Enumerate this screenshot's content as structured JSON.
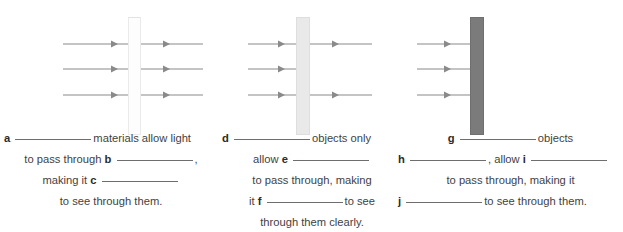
{
  "diagram": {
    "panels": [
      {
        "id": "panel-transparent",
        "material_type": "transparent",
        "barrier_color": "#fdfdfd",
        "barrier_border": "#eaeaea",
        "rays_in": 3,
        "rays_out": 3,
        "ray_color": "#8a8a8a",
        "note": "all three light rays pass through the barrier"
      },
      {
        "id": "panel-translucent",
        "material_type": "translucent",
        "barrier_color": "#e9e9e9",
        "barrier_border": "#dedede",
        "rays_in": 3,
        "rays_out": 2,
        "ray_color": "#8a8a8a",
        "note": "middle ray is blocked; top and bottom rays pass through"
      },
      {
        "id": "panel-opaque",
        "material_type": "opaque",
        "barrier_color": "#7b7b7b",
        "barrier_border": "#6f6f6f",
        "rays_in": 3,
        "rays_out": 0,
        "ray_color": "#8a8a8a",
        "note": "all rays are blocked at the barrier"
      }
    ]
  },
  "captions": {
    "transparent": {
      "lines": [
        {
          "align": "left",
          "parts": [
            {
              "type": "label",
              "text": "a"
            },
            {
              "type": "blank",
              "size": "long"
            },
            {
              "type": "text",
              "text": "materials allow light"
            }
          ]
        },
        {
          "align": "center",
          "parts": [
            {
              "type": "text",
              "text": "to pass through"
            },
            {
              "type": "label",
              "text": "b"
            },
            {
              "type": "blank",
              "size": "long"
            },
            {
              "type": "text",
              "text": ","
            }
          ]
        },
        {
          "align": "center",
          "parts": [
            {
              "type": "text",
              "text": "making it"
            },
            {
              "type": "label",
              "text": "c"
            },
            {
              "type": "blank",
              "size": "long"
            }
          ]
        },
        {
          "align": "center",
          "parts": [
            {
              "type": "text",
              "text": "to see through them."
            }
          ]
        }
      ]
    },
    "translucent": {
      "lines": [
        {
          "align": "left",
          "parts": [
            {
              "type": "label",
              "text": "d"
            },
            {
              "type": "blank",
              "size": "long"
            },
            {
              "type": "text",
              "text": "objects only"
            }
          ]
        },
        {
          "align": "center",
          "parts": [
            {
              "type": "text",
              "text": "allow"
            },
            {
              "type": "label",
              "text": "e"
            },
            {
              "type": "blank",
              "size": "long"
            }
          ]
        },
        {
          "align": "center",
          "parts": [
            {
              "type": "text",
              "text": "to pass through, making"
            }
          ]
        },
        {
          "align": "center",
          "parts": [
            {
              "type": "text",
              "text": "it"
            },
            {
              "type": "label",
              "text": "f"
            },
            {
              "type": "blank",
              "size": "long"
            },
            {
              "type": "text",
              "text": "to see"
            }
          ]
        },
        {
          "align": "center",
          "parts": [
            {
              "type": "text",
              "text": "through them clearly."
            }
          ]
        }
      ]
    },
    "opaque": {
      "lines": [
        {
          "align": "center",
          "parts": [
            {
              "type": "label",
              "text": "g"
            },
            {
              "type": "blank",
              "size": "long"
            },
            {
              "type": "text",
              "text": "objects"
            }
          ]
        },
        {
          "align": "left",
          "parts": [
            {
              "type": "label",
              "text": "h"
            },
            {
              "type": "blank",
              "size": "long"
            },
            {
              "type": "text",
              "text": ", allow"
            },
            {
              "type": "label",
              "text": "i"
            },
            {
              "type": "blank",
              "size": "long"
            }
          ]
        },
        {
          "align": "center",
          "parts": [
            {
              "type": "text",
              "text": "to pass through, making it"
            }
          ]
        },
        {
          "align": "left",
          "parts": [
            {
              "type": "label",
              "text": "j"
            },
            {
              "type": "blank",
              "size": "long"
            },
            {
              "type": "text",
              "text": "to see through them."
            }
          ]
        }
      ]
    }
  }
}
